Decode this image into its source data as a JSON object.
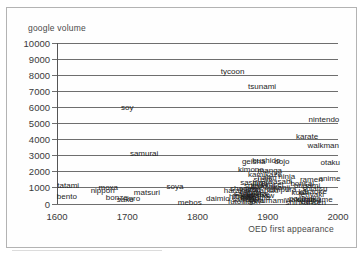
{
  "chart_data": {
    "type": "scatter",
    "title": "",
    "ylabel": "google volume",
    "xlabel": "OED first appearance",
    "xlim": [
      1600,
      2000
    ],
    "ylim": [
      0,
      10000
    ],
    "x_ticks": [
      1600,
      1700,
      1800,
      1900,
      2000
    ],
    "y_ticks": [
      0,
      1000,
      2000,
      3000,
      4000,
      5000,
      6000,
      7000,
      8000,
      9000,
      10000
    ],
    "grid": "horizontal",
    "legend": false,
    "marker": "text-label-only",
    "points": [
      {
        "label": "tycoon",
        "year": 1850,
        "volume": 8200
      },
      {
        "label": "tsunami",
        "year": 1892,
        "volume": 7300
      },
      {
        "label": "soy",
        "year": 1700,
        "volume": 6000
      },
      {
        "label": "nintendo",
        "year": 1980,
        "volume": 5200
      },
      {
        "label": "karate",
        "year": 1956,
        "volume": 4200
      },
      {
        "label": "walkman",
        "year": 1979,
        "volume": 3600
      },
      {
        "label": "samurai",
        "year": 1724,
        "volume": 3100
      },
      {
        "label": "otaku",
        "year": 1989,
        "volume": 2550
      },
      {
        "label": "geisha",
        "year": 1880,
        "volume": 2600
      },
      {
        "label": "bushido",
        "year": 1898,
        "volume": 2650
      },
      {
        "label": "dojo",
        "year": 1920,
        "volume": 2600
      },
      {
        "label": "kimono",
        "year": 1876,
        "volume": 2100
      },
      {
        "label": "manga",
        "year": 1903,
        "volume": 2050
      },
      {
        "label": "tatami",
        "year": 1616,
        "volume": 1150
      },
      {
        "label": "bento",
        "year": 1614,
        "volume": 420
      },
      {
        "label": "moxa",
        "year": 1673,
        "volume": 1000
      },
      {
        "label": "nippon",
        "year": 1665,
        "volume": 800
      },
      {
        "label": "bonze",
        "year": 1685,
        "volume": 380
      },
      {
        "label": "sake",
        "year": 1697,
        "volume": 250
      },
      {
        "label": "inro",
        "year": 1709,
        "volume": 330
      },
      {
        "label": "matsuri",
        "year": 1728,
        "volume": 700
      },
      {
        "label": "soya",
        "year": 1768,
        "volume": 1050
      },
      {
        "label": "mebos",
        "year": 1789,
        "volume": 90
      },
      {
        "label": "daimio",
        "year": 1829,
        "volume": 300
      },
      {
        "label": "futon",
        "year": 1856,
        "volume": 120
      },
      {
        "label": "harakiri",
        "year": 1856,
        "volume": 820
      },
      {
        "label": "hibachi",
        "year": 1863,
        "volume": 420
      },
      {
        "label": "shogun",
        "year": 1865,
        "volume": 950
      },
      {
        "label": "mikado",
        "year": 1868,
        "volume": 480
      },
      {
        "label": "samisen",
        "year": 1870,
        "volume": 220
      },
      {
        "label": "noh",
        "year": 1871,
        "volume": 400
      },
      {
        "label": "jujitsu",
        "year": 1875,
        "volume": 900
      },
      {
        "label": "sayonara",
        "year": 1875,
        "volume": 620
      },
      {
        "label": "obi",
        "year": 1876,
        "volume": 280
      },
      {
        "label": "haori",
        "year": 1877,
        "volume": 100
      },
      {
        "label": "sashimi",
        "year": 1880,
        "volume": 1320
      },
      {
        "label": "sumo",
        "year": 1880,
        "volume": 1150
      },
      {
        "label": "tofu",
        "year": 1880,
        "volume": 700
      },
      {
        "label": "zen",
        "year": 1881,
        "volume": 850
      },
      {
        "label": "satsuma",
        "year": 1882,
        "volume": 380
      },
      {
        "label": "netsuke",
        "year": 1883,
        "volume": 560
      },
      {
        "label": "geta",
        "year": 1884,
        "volume": 160
      },
      {
        "label": "rickshaw",
        "year": 1887,
        "volume": 520
      },
      {
        "label": "judo",
        "year": 1889,
        "volume": 1250
      },
      {
        "label": "banzai",
        "year": 1893,
        "volume": 1050
      },
      {
        "label": "sushi",
        "year": 1893,
        "volume": 1500
      },
      {
        "label": "kamikaze",
        "year": 1896,
        "volume": 1800
      },
      {
        "label": "haiku",
        "year": 1899,
        "volume": 1650
      },
      {
        "label": "kabuki",
        "year": 1899,
        "volume": 800
      },
      {
        "label": "sensei",
        "year": 1906,
        "volume": 1180
      },
      {
        "label": "umami",
        "year": 1908,
        "volume": 200
      },
      {
        "label": "wasabi",
        "year": 1917,
        "volume": 1350
      },
      {
        "label": "tempura",
        "year": 1920,
        "volume": 880
      },
      {
        "label": "kanji",
        "year": 1920,
        "volume": 1020
      },
      {
        "label": "ninja",
        "year": 1927,
        "volume": 1700
      },
      {
        "label": "koan",
        "year": 1946,
        "volume": 680
      },
      {
        "label": "wakame",
        "year": 1946,
        "volume": 220
      },
      {
        "label": "bonsai",
        "year": 1949,
        "volume": 1250
      },
      {
        "label": "pachinko",
        "year": 1953,
        "volume": 320
      },
      {
        "label": "shinkansen",
        "year": 1954,
        "volume": 50
      },
      {
        "label": "origami",
        "year": 1956,
        "volume": 1150
      },
      {
        "label": "dashi",
        "year": 1961,
        "volume": 120
      },
      {
        "label": "ramen",
        "year": 1962,
        "volume": 1480
      },
      {
        "label": "teriyaki",
        "year": 1962,
        "volume": 580
      },
      {
        "label": "karaoke",
        "year": 1964,
        "volume": 750
      },
      {
        "label": "edamame",
        "year": 1967,
        "volume": 280
      },
      {
        "label": "shiatsu",
        "year": 1967,
        "volume": 950
      },
      {
        "label": "anime",
        "year": 1988,
        "volume": 1550
      }
    ]
  }
}
